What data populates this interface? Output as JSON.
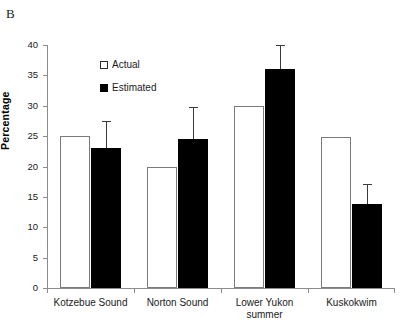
{
  "panel": {
    "label": "B"
  },
  "legend": {
    "position": "inside-top-left",
    "items": [
      {
        "label": "Actual",
        "marker": "open-square",
        "color": "#ffffff"
      },
      {
        "label": "Estimated",
        "marker": "filled-square",
        "color": "#000000"
      }
    ]
  },
  "axes": {
    "ylabel": "Percentage",
    "yticks": [
      "0",
      "5",
      "10",
      "15",
      "20",
      "25",
      "30",
      "35",
      "40"
    ],
    "xlabel": ""
  },
  "chart_data": {
    "type": "bar",
    "title": "",
    "xlabel": "",
    "ylabel": "Percentage",
    "ylim": [
      0,
      40
    ],
    "ytick_step": 5,
    "grid": false,
    "legend_position": "inside-top-left",
    "categories": [
      "Kotzebue Sound",
      "Norton Sound",
      "Lower Yukon summer",
      "Kuskokwim"
    ],
    "category_lines": [
      [
        "Kotzebue Sound"
      ],
      [
        "Norton Sound"
      ],
      [
        "Lower Yukon",
        "summer"
      ],
      [
        "Kuskokwim"
      ]
    ],
    "series": [
      {
        "name": "Actual",
        "marker": "open-square",
        "fill": "#ffffff",
        "edge": "#7a7a7a",
        "values": [
          25.0,
          20.0,
          30.0,
          24.8
        ],
        "errors": [
          null,
          null,
          null,
          null
        ]
      },
      {
        "name": "Estimated",
        "marker": "filled-square",
        "fill": "#000000",
        "edge": "#000000",
        "values": [
          23.0,
          24.6,
          36.1,
          13.9
        ],
        "errors": [
          4.5,
          5.2,
          3.9,
          3.3
        ],
        "error_tops": [
          27.5,
          29.8,
          40.0,
          17.2
        ]
      }
    ]
  }
}
